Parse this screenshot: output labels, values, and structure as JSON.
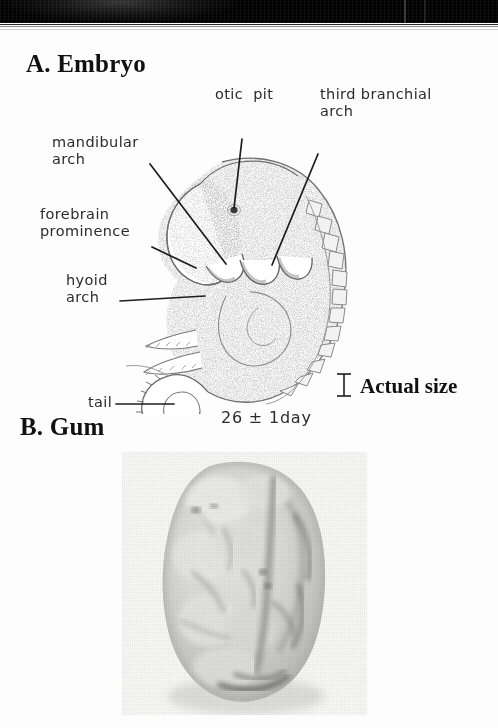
{
  "page": {
    "background_color": "#fdfdfd",
    "ink_color": "#1d1d1d",
    "scan_artifact_color": "#111111"
  },
  "sections": {
    "a": {
      "heading": "A. Embryo"
    },
    "b": {
      "heading": "B. Gum"
    }
  },
  "embryo": {
    "caption_age": "26 ± 1day",
    "scale_label": "Actual size",
    "scale_marker": "i-beam-scale-bar",
    "labels": [
      {
        "id": "mandibular-arch",
        "text": "mandibular\narch",
        "x": 52,
        "y": 105,
        "align": "left"
      },
      {
        "id": "otic-pit",
        "text": "otic  pit",
        "x": 215,
        "y": 85,
        "align": "left"
      },
      {
        "id": "third-branchial-arch",
        "text": "third branchial\narch",
        "x": 320,
        "y": 85,
        "align": "left"
      },
      {
        "id": "forebrain-prominence",
        "text": "forebrain\nprominence",
        "x": 40,
        "y": 176,
        "align": "left"
      },
      {
        "id": "hyoid-arch",
        "text": "hyoid\narch",
        "x": 66,
        "y": 240,
        "align": "left"
      },
      {
        "id": "tail",
        "text": "tail",
        "x": 88,
        "y": 364,
        "align": "left"
      }
    ],
    "leaders": [
      {
        "id": "leader-mandibular-arch",
        "x1": 150,
        "y1": 130,
        "x2": 226,
        "y2": 230
      },
      {
        "id": "leader-otic-pit",
        "x1": 242,
        "y1": 105,
        "x2": 234,
        "y2": 175
      },
      {
        "id": "leader-third-branchial-arch",
        "x1": 318,
        "y1": 120,
        "x2": 271,
        "y2": 230
      },
      {
        "id": "leader-forebrain-prominence",
        "x1": 152,
        "y1": 213,
        "x2": 193,
        "y2": 233
      },
      {
        "id": "leader-hyoid-arch",
        "x1": 120,
        "y1": 267,
        "x2": 205,
        "y2": 262
      },
      {
        "id": "leader-tail",
        "x1": 116,
        "y1": 370,
        "x2": 174,
        "y2": 370
      }
    ],
    "anatomy_parts": [
      "forebrain-prominence",
      "mandibular-arch",
      "hyoid-arch",
      "third-branchial-arch",
      "otic-pit",
      "somites",
      "upper-limb-bud",
      "lower-limb-bud",
      "tail",
      "heart-prominence"
    ]
  },
  "gum": {
    "image_description": "grayscale photograph of gum specimen",
    "frame": {
      "x": 122,
      "y": 452,
      "width": 245,
      "height": 263
    }
  }
}
